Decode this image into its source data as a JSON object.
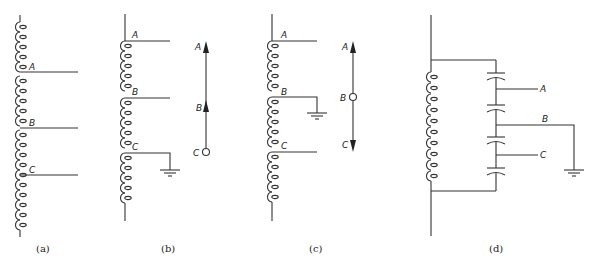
{
  "figure": {
    "panels": [
      {
        "id": "a",
        "caption": "(a)",
        "taps": [
          "A",
          "B",
          "C"
        ],
        "description": "Tapped winding with three taps A, B, C"
      },
      {
        "id": "b",
        "caption": "(b)",
        "taps": [
          "A",
          "B",
          "C"
        ],
        "grounded_tap": "C",
        "phasor": {
          "labels": [
            "A",
            "B",
            "C"
          ],
          "origin": "C"
        }
      },
      {
        "id": "c",
        "caption": "(c)",
        "taps": [
          "A",
          "B",
          "C"
        ],
        "grounded_tap": "B",
        "phasor": {
          "labels": [
            "A",
            "B",
            "C"
          ],
          "origin": "B"
        }
      },
      {
        "id": "d",
        "caption": "(d)",
        "taps": [
          "A",
          "B",
          "C"
        ],
        "grounded_tap": "B",
        "description": "Winding in parallel with series capacitor divider of four capacitors"
      }
    ]
  },
  "labels": {
    "a_A": "A",
    "a_B": "B",
    "a_C": "C",
    "b_A": "A",
    "b_B": "B",
    "b_C": "C",
    "b_pA": "A",
    "b_pB": "B",
    "b_pC": "C",
    "c_A": "A",
    "c_B": "B",
    "c_C": "C",
    "c_pA": "A",
    "c_pB": "B",
    "c_pC": "C",
    "d_A": "A",
    "d_B": "B",
    "d_C": "C"
  },
  "captions": {
    "a": "(a)",
    "b": "(b)",
    "c": "(c)",
    "d": "(d)"
  }
}
